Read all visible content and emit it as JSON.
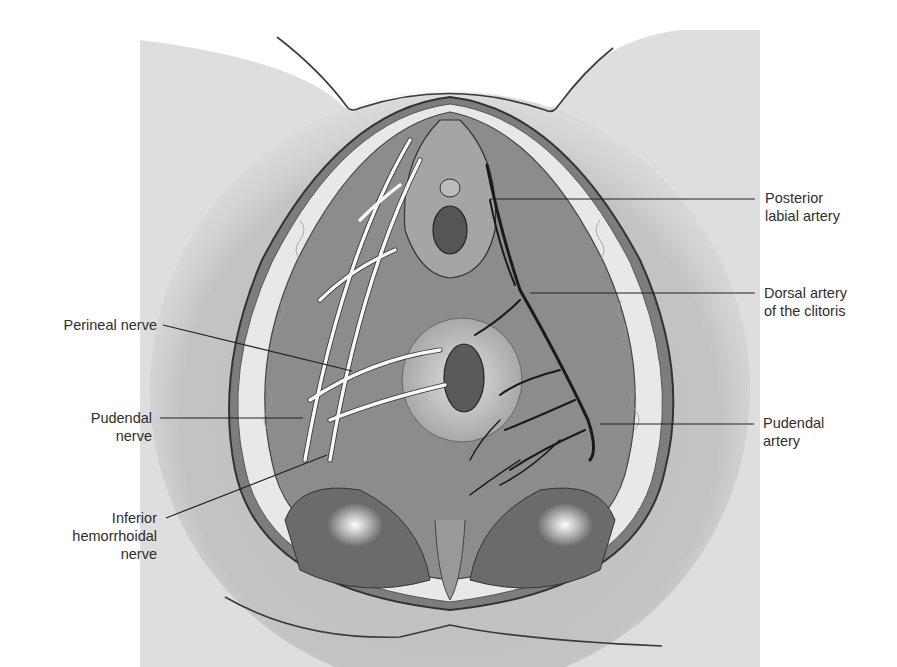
{
  "figure": {
    "colors": {
      "background": "#ffffff",
      "skin": "#bdbdbd",
      "skin_dark": "#9e9e9e",
      "outline": "#3a3a3a",
      "muscle": "#8a8a8a",
      "fat": "#ececec",
      "nerve": "#f7f7f7",
      "artery": "#1a1a1a",
      "leader_line": "#222222"
    }
  },
  "labels_left": [
    {
      "id": "perineal-nerve",
      "lines": [
        "Perineal nerve"
      ]
    },
    {
      "id": "pudendal-nerve",
      "lines": [
        "Pudendal",
        "nerve"
      ]
    },
    {
      "id": "inferior-hemorrhoidal-nerve",
      "lines": [
        "Inferior",
        "hemorrhoidal",
        "nerve"
      ]
    }
  ],
  "labels_right": [
    {
      "id": "posterior-labial-artery",
      "lines": [
        "Posterior",
        "labial artery"
      ]
    },
    {
      "id": "dorsal-artery-clitoris",
      "lines": [
        "Dorsal artery",
        "of the clitoris"
      ]
    },
    {
      "id": "pudendal-artery",
      "lines": [
        "Pudendal",
        "artery"
      ]
    }
  ]
}
